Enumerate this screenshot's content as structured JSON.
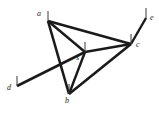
{
  "figure": {
    "name": "undirected-graph-diagram",
    "width": 159,
    "height": 114,
    "background_color": "#ffffff",
    "stroke_color": "#1a1a1a",
    "tick_color": "#3a3a3a"
  },
  "graph": {
    "type": "undirected-graph",
    "node_count": 6,
    "edge_count": 8,
    "nodes": [
      {
        "id": "a",
        "label": "a",
        "x": 48,
        "y": 21,
        "label_x": 37,
        "label_y": 10,
        "tick_dx": 0,
        "tick_dy": -10
      },
      {
        "id": "e",
        "label": "e",
        "x": 146,
        "y": 18,
        "label_x": 150,
        "label_y": 14,
        "tick_dx": 0,
        "tick_dy": -10
      },
      {
        "id": "c",
        "label": "c",
        "x": 131,
        "y": 44,
        "label_x": 136,
        "label_y": 41,
        "tick_dx": 0,
        "tick_dy": -10
      },
      {
        "id": "s",
        "label": "s",
        "x": 85,
        "y": 52,
        "label_x": 76,
        "label_y": 54,
        "tick_dx": 0,
        "tick_dy": -10
      },
      {
        "id": "d",
        "label": "d",
        "x": 17,
        "y": 86,
        "label_x": 7,
        "label_y": 84,
        "tick_dx": 0,
        "tick_dy": -10
      },
      {
        "id": "b",
        "label": "b",
        "x": 69,
        "y": 94,
        "label_x": 65,
        "label_y": 97,
        "tick_dx": 0,
        "tick_dy": -10
      }
    ],
    "edges": [
      {
        "id": "edge-a-c",
        "from": "a",
        "to": "c",
        "x1": 48,
        "y1": 21,
        "x2": 131,
        "y2": 44,
        "width": 2.6
      },
      {
        "id": "edge-a-s",
        "from": "a",
        "to": "s",
        "x1": 48,
        "y1": 21,
        "x2": 85,
        "y2": 52,
        "width": 2.4
      },
      {
        "id": "edge-a-b",
        "from": "a",
        "to": "b",
        "x1": 48,
        "y1": 21,
        "x2": 69,
        "y2": 94,
        "width": 2.6
      },
      {
        "id": "edge-s-c",
        "from": "s",
        "to": "c",
        "x1": 85,
        "y1": 52,
        "x2": 131,
        "y2": 44,
        "width": 2.4
      },
      {
        "id": "edge-s-b",
        "from": "s",
        "to": "b",
        "x1": 85,
        "y1": 52,
        "x2": 69,
        "y2": 94,
        "width": 2.4
      },
      {
        "id": "edge-b-c",
        "from": "b",
        "to": "c",
        "x1": 69,
        "y1": 94,
        "x2": 131,
        "y2": 44,
        "width": 2.6
      },
      {
        "id": "edge-c-e",
        "from": "c",
        "to": "e",
        "x1": 131,
        "y1": 44,
        "x2": 146,
        "y2": 18,
        "width": 2.4
      },
      {
        "id": "edge-d-s",
        "from": "d",
        "to": "s",
        "x1": 17,
        "y1": 86,
        "x2": 85,
        "y2": 52,
        "width": 2.6
      }
    ]
  }
}
